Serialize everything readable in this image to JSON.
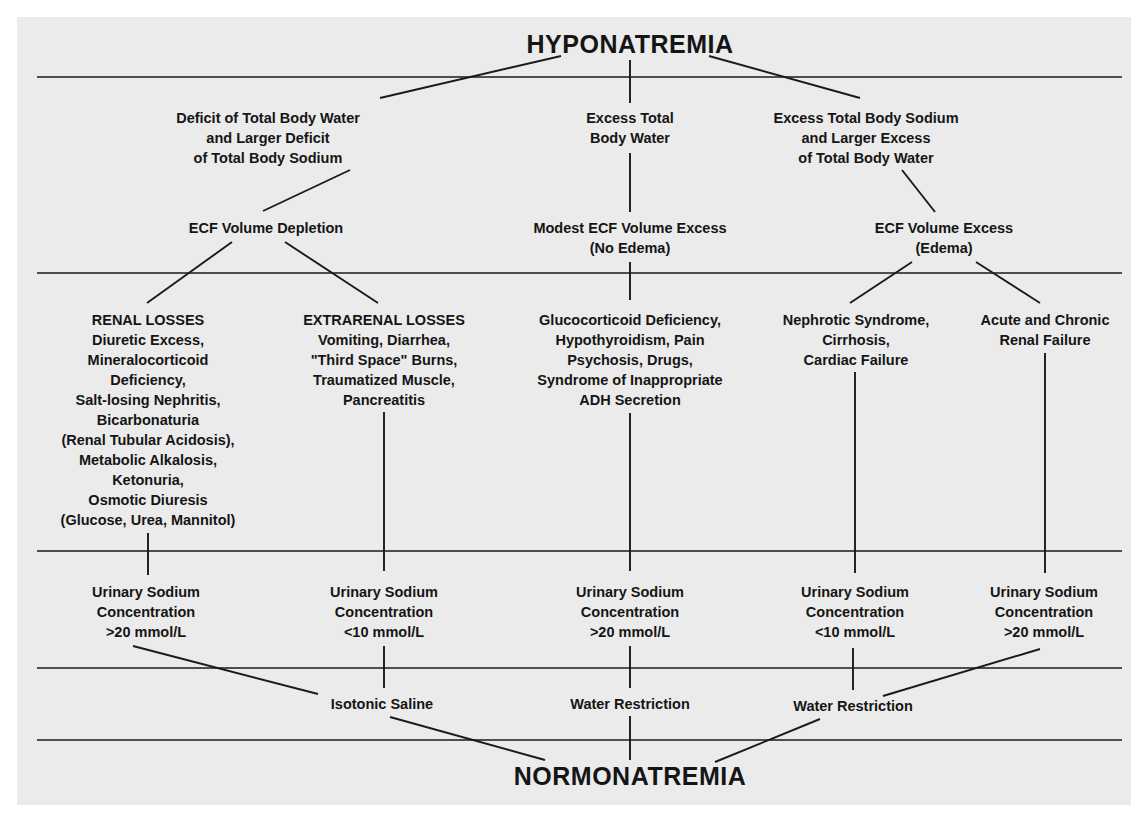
{
  "diagram": {
    "type": "flowchart",
    "title_top": "HYPONATREMIA",
    "title_bottom": "NORMONATREMIA",
    "colors": {
      "background": "#ebebeb",
      "ink": "#151515",
      "page": "#ffffff"
    },
    "categories": [
      {
        "id": "deficit",
        "lines": [
          "Deficit of Total Body Water",
          "and Larger Deficit",
          "of Total Body Sodium"
        ]
      },
      {
        "id": "excess-water",
        "lines": [
          "Excess Total",
          "Body Water"
        ]
      },
      {
        "id": "excess-sodium",
        "lines": [
          "Excess Total Body Sodium",
          "and Larger Excess",
          "of Total Body Water"
        ]
      }
    ],
    "volume_states": [
      {
        "id": "depletion",
        "lines": [
          "ECF Volume Depletion"
        ]
      },
      {
        "id": "modest",
        "lines": [
          "Modest ECF Volume Excess",
          "(No Edema)"
        ]
      },
      {
        "id": "edema",
        "lines": [
          "ECF Volume Excess",
          "(Edema)"
        ]
      }
    ],
    "causes": [
      {
        "id": "renal",
        "lines": [
          "RENAL LOSSES",
          "Diuretic Excess,",
          "Mineralocorticoid",
          "Deficiency,",
          "Salt-losing Nephritis,",
          "Bicarbonaturia",
          "(Renal Tubular Acidosis),",
          "Metabolic Alkalosis,",
          "Ketonuria,",
          "Osmotic Diuresis",
          "(Glucose, Urea, Mannitol)"
        ]
      },
      {
        "id": "extrarenal",
        "lines": [
          "EXTRARENAL LOSSES",
          "Vomiting, Diarrhea,",
          "\"Third Space\" Burns,",
          "Traumatized Muscle,",
          "Pancreatitis"
        ]
      },
      {
        "id": "glucocorticoid",
        "lines": [
          "Glucocorticoid Deficiency,",
          "Hypothyroidism, Pain",
          "Psychosis, Drugs,",
          "Syndrome of Inappropriate",
          "ADH Secretion"
        ]
      },
      {
        "id": "nephrotic",
        "lines": [
          "Nephrotic Syndrome,",
          "Cirrhosis,",
          "Cardiac Failure"
        ]
      },
      {
        "id": "renal-failure",
        "lines": [
          "Acute and Chronic",
          "Renal Failure"
        ]
      }
    ],
    "urinary": [
      {
        "lines": [
          "Urinary Sodium",
          "Concentration",
          ">20 mmol/L"
        ]
      },
      {
        "lines": [
          "Urinary Sodium",
          "Concentration",
          "<10 mmol/L"
        ]
      },
      {
        "lines": [
          "Urinary Sodium",
          "Concentration",
          ">20 mmol/L"
        ]
      },
      {
        "lines": [
          "Urinary Sodium",
          "Concentration",
          "<10 mmol/L"
        ]
      },
      {
        "lines": [
          "Urinary Sodium",
          "Concentration",
          ">20 mmol/L"
        ]
      }
    ],
    "treatments": [
      {
        "id": "isotonic",
        "lines": [
          "Isotonic Saline"
        ]
      },
      {
        "id": "water-1",
        "lines": [
          "Water Restriction"
        ]
      },
      {
        "id": "water-2",
        "lines": [
          "Water Restriction"
        ]
      }
    ]
  }
}
